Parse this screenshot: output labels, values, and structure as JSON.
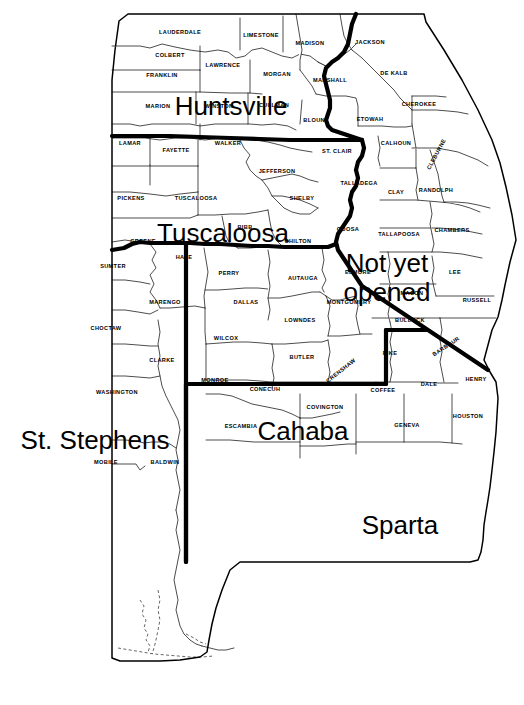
{
  "map": {
    "title": "Alabama Federal Land Office Districts",
    "region": "Alabama",
    "background_color": "#ffffff",
    "line_color": "#000000",
    "district_labels": [
      {
        "name": "Huntsville",
        "text": "Huntsville",
        "x": 231,
        "y": 115,
        "size": 27
      },
      {
        "name": "Tuscaloosa",
        "text": "Tuscaloosa",
        "x": 223,
        "y": 242,
        "size": 27
      },
      {
        "name": "NotYetOpened",
        "text": "Not yet",
        "x": 387,
        "y": 272,
        "size": 27
      },
      {
        "name": "NotYetOpened2",
        "text": "opened",
        "x": 387,
        "y": 301,
        "size": 27
      },
      {
        "name": "StStephens",
        "text": "St. Stephens",
        "x": 95,
        "y": 449,
        "size": 27
      },
      {
        "name": "Cahaba",
        "text": "Cahaba",
        "x": 303,
        "y": 440,
        "size": 27
      },
      {
        "name": "Sparta",
        "text": "Sparta",
        "x": 400,
        "y": 534,
        "size": 27
      }
    ],
    "counties": [
      {
        "name": "LAUDERDALE",
        "label": "LAUDERDALE",
        "x": 180,
        "y": 34
      },
      {
        "name": "LIMESTONE",
        "label": "LIMESTONE",
        "x": 261,
        "y": 37
      },
      {
        "name": "MADISON",
        "label": "MADISON",
        "x": 310,
        "y": 45
      },
      {
        "name": "JACKSON",
        "label": "JACKSON",
        "x": 370,
        "y": 44
      },
      {
        "name": "COLBERT",
        "label": "COLBERT",
        "x": 170,
        "y": 57
      },
      {
        "name": "LAWRENCE",
        "label": "LAWRENCE",
        "x": 223,
        "y": 67
      },
      {
        "name": "MORGAN",
        "label": "MORGAN",
        "x": 277,
        "y": 76
      },
      {
        "name": "MARSHALL",
        "label": "MARSHALL",
        "x": 330,
        "y": 82
      },
      {
        "name": "DE KALB",
        "label": "DE KALB",
        "x": 394,
        "y": 75
      },
      {
        "name": "FRANKLIN",
        "label": "FRANKLIN",
        "x": 162,
        "y": 77
      },
      {
        "name": "MARION",
        "label": "MARION",
        "x": 158,
        "y": 108
      },
      {
        "name": "WINSTON",
        "label": "WINSTON",
        "x": 219,
        "y": 108
      },
      {
        "name": "CULLMAN",
        "label": "CULLMAN",
        "x": 274,
        "y": 107
      },
      {
        "name": "CHEROKEE",
        "label": "CHEROKEE",
        "x": 419,
        "y": 106
      },
      {
        "name": "BLOUNT",
        "label": "BLOUNT",
        "x": 316,
        "y": 122
      },
      {
        "name": "ETOWAH",
        "label": "ETOWAH",
        "x": 370,
        "y": 121
      },
      {
        "name": "LAMAR",
        "label": "LAMAR",
        "x": 130,
        "y": 145
      },
      {
        "name": "FAYETTE",
        "label": "FAYETTE",
        "x": 176,
        "y": 152
      },
      {
        "name": "WALKER",
        "label": "WALKER",
        "x": 228,
        "y": 145
      },
      {
        "name": "ST. CLAIR",
        "label": "ST. CLAIR",
        "x": 337,
        "y": 153
      },
      {
        "name": "CALHOUN",
        "label": "CALHOUN",
        "x": 396,
        "y": 145
      },
      {
        "name": "CLEBURNE",
        "label": "CLEBURNE",
        "x": 438,
        "y": 155,
        "rotate": -62
      },
      {
        "name": "JEFFERSON",
        "label": "JEFFERSON",
        "x": 277,
        "y": 173
      },
      {
        "name": "TALLADEGA",
        "label": "TALLADEGA",
        "x": 359,
        "y": 185
      },
      {
        "name": "RANDOLPH",
        "label": "RANDOLPH",
        "x": 436,
        "y": 192
      },
      {
        "name": "PICKENS",
        "label": "PICKENS",
        "x": 131,
        "y": 200
      },
      {
        "name": "TUSCALOOSA",
        "label": "TUSCALOOSA",
        "x": 196,
        "y": 200
      },
      {
        "name": "SHELBY",
        "label": "SHELBY",
        "x": 302,
        "y": 200
      },
      {
        "name": "CLAY",
        "label": "CLAY",
        "x": 396,
        "y": 194
      },
      {
        "name": "BIBB",
        "label": "BIBB",
        "x": 245,
        "y": 229
      },
      {
        "name": "COOSA",
        "label": "COOSA",
        "x": 348,
        "y": 231
      },
      {
        "name": "TALLAPOOSA",
        "label": "TALLAPOOSA",
        "x": 399,
        "y": 236
      },
      {
        "name": "CHAMBERS",
        "label": "CHAMBERS",
        "x": 452,
        "y": 232
      },
      {
        "name": "GREENE",
        "label": "GREENE",
        "x": 143,
        "y": 243
      },
      {
        "name": "CHILTON",
        "label": "CHILTON",
        "x": 298,
        "y": 243
      },
      {
        "name": "HALE",
        "label": "HALE",
        "x": 184,
        "y": 259
      },
      {
        "name": "SUMTER",
        "label": "SUMTER",
        "x": 113,
        "y": 268
      },
      {
        "name": "PERRY",
        "label": "PERRY",
        "x": 229,
        "y": 275
      },
      {
        "name": "AUTAUGA",
        "label": "AUTAUGA",
        "x": 303,
        "y": 280
      },
      {
        "name": "ELMORE",
        "label": "ELMORE",
        "x": 358,
        "y": 274
      },
      {
        "name": "LEE",
        "label": "LEE",
        "x": 455,
        "y": 274
      },
      {
        "name": "MACON",
        "label": "MACON",
        "x": 412,
        "y": 295
      },
      {
        "name": "MARENGO",
        "label": "MARENGO",
        "x": 165,
        "y": 304
      },
      {
        "name": "DALLAS",
        "label": "DALLAS",
        "x": 246,
        "y": 304
      },
      {
        "name": "MONTGOMERY",
        "label": "MONTGOMERY",
        "x": 349,
        "y": 304
      },
      {
        "name": "RUSSELL",
        "label": "RUSSELL",
        "x": 477,
        "y": 302
      },
      {
        "name": "LOWNDES",
        "label": "LOWNDES",
        "x": 300,
        "y": 322
      },
      {
        "name": "BULLOCK",
        "label": "BULLOCK",
        "x": 410,
        "y": 322
      },
      {
        "name": "CHOCTAW",
        "label": "CHOCTAW",
        "x": 106,
        "y": 330
      },
      {
        "name": "WILCOX",
        "label": "WILCOX",
        "x": 226,
        "y": 340
      },
      {
        "name": "BARBOUR",
        "label": "BARBOUR",
        "x": 447,
        "y": 348,
        "rotate": -33
      },
      {
        "name": "BUTLER",
        "label": "BUTLER",
        "x": 302,
        "y": 359
      },
      {
        "name": "PIKE",
        "label": "PIKE",
        "x": 390,
        "y": 355
      },
      {
        "name": "CLARKE",
        "label": "CLARKE",
        "x": 162,
        "y": 362
      },
      {
        "name": "CRENSHAW",
        "label": "CRENSHAW",
        "x": 342,
        "y": 372,
        "rotate": -38
      },
      {
        "name": "MONROE",
        "label": "MONROE",
        "x": 215,
        "y": 382
      },
      {
        "name": "HENRY",
        "label": "HENRY",
        "x": 476,
        "y": 381
      },
      {
        "name": "CONECUH",
        "label": "CONECUH",
        "x": 265,
        "y": 391
      },
      {
        "name": "COFFEE",
        "label": "COFFEE",
        "x": 383,
        "y": 392
      },
      {
        "name": "DALE",
        "label": "DALE",
        "x": 429,
        "y": 386
      },
      {
        "name": "WASHINGTON",
        "label": "WASHINGTON",
        "x": 117,
        "y": 394
      },
      {
        "name": "COVINGTON",
        "label": "COVINGTON",
        "x": 325,
        "y": 409
      },
      {
        "name": "HOUSTON",
        "label": "HOUSTON",
        "x": 468,
        "y": 418
      },
      {
        "name": "ESCAMBIA",
        "label": "ESCAMBIA",
        "x": 241,
        "y": 428
      },
      {
        "name": "GENEVA",
        "label": "GENEVA",
        "x": 407,
        "y": 427
      },
      {
        "name": "MOBILE",
        "label": "MOBILE",
        "x": 106,
        "y": 464
      },
      {
        "name": "BALDWIN",
        "label": "BALDWIN",
        "x": 165,
        "y": 464
      }
    ]
  }
}
